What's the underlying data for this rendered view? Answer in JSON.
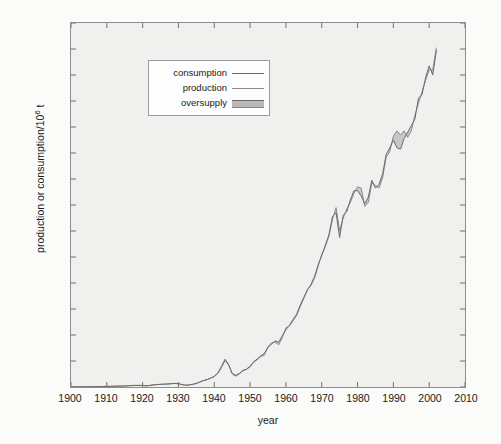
{
  "chart_data": {
    "type": "line",
    "title": "",
    "subtitle": "",
    "xlabel": "year",
    "ylabel": "production or consumption/10⁶ t",
    "ylabel_html": "production or consumption/10<sup>6</sup> t",
    "xlim": [
      1900,
      2010
    ],
    "ylim": [
      0,
      28
    ],
    "xticks": [
      1900,
      1910,
      1920,
      1930,
      1940,
      1950,
      1960,
      1970,
      1980,
      1990,
      2000,
      2010
    ],
    "yticks": [
      0,
      2,
      4,
      6,
      8,
      10,
      12,
      14,
      16,
      18,
      20,
      22,
      24,
      26,
      28
    ],
    "grid": false,
    "legend_position": "upper-left-inset",
    "legend": [
      {
        "label": "consumption",
        "marker": "line",
        "color": "#6b6b6b"
      },
      {
        "label": "production",
        "marker": "line",
        "color": "#8a8a8a"
      },
      {
        "label": "oversupply",
        "marker": "band",
        "color": "#b9b9b9"
      }
    ],
    "x": [
      1900,
      1901,
      1902,
      1903,
      1904,
      1905,
      1906,
      1907,
      1908,
      1909,
      1910,
      1911,
      1912,
      1913,
      1914,
      1915,
      1916,
      1917,
      1918,
      1919,
      1920,
      1921,
      1922,
      1923,
      1924,
      1925,
      1926,
      1927,
      1928,
      1929,
      1930,
      1931,
      1932,
      1933,
      1934,
      1935,
      1936,
      1937,
      1938,
      1939,
      1940,
      1941,
      1942,
      1943,
      1944,
      1945,
      1946,
      1947,
      1948,
      1949,
      1950,
      1951,
      1952,
      1953,
      1954,
      1955,
      1956,
      1957,
      1958,
      1959,
      1960,
      1961,
      1962,
      1963,
      1964,
      1965,
      1966,
      1967,
      1968,
      1969,
      1970,
      1971,
      1972,
      1973,
      1974,
      1975,
      1976,
      1977,
      1978,
      1979,
      1980,
      1981,
      1982,
      1983,
      1984,
      1985,
      1986,
      1987,
      1988,
      1989,
      1990,
      1991,
      1992,
      1993,
      1994,
      1995,
      1996,
      1997,
      1998,
      1999,
      2000,
      2001,
      2002
    ],
    "series": [
      {
        "name": "production",
        "color": "#8a8a8a",
        "values": [
          0.01,
          0.01,
          0.01,
          0.02,
          0.02,
          0.02,
          0.03,
          0.03,
          0.03,
          0.04,
          0.05,
          0.05,
          0.06,
          0.07,
          0.07,
          0.08,
          0.1,
          0.12,
          0.13,
          0.12,
          0.13,
          0.08,
          0.12,
          0.17,
          0.19,
          0.21,
          0.22,
          0.23,
          0.26,
          0.28,
          0.27,
          0.18,
          0.13,
          0.15,
          0.2,
          0.27,
          0.38,
          0.5,
          0.57,
          0.7,
          0.82,
          1.1,
          1.6,
          2.15,
          1.75,
          1.0,
          0.83,
          1.0,
          1.25,
          1.35,
          1.55,
          1.9,
          2.1,
          2.35,
          2.45,
          3.1,
          3.4,
          3.45,
          3.25,
          3.8,
          4.55,
          4.7,
          5.1,
          5.5,
          6.2,
          6.8,
          7.5,
          7.8,
          8.4,
          9.3,
          10.2,
          10.8,
          11.6,
          12.9,
          13.8,
          12.0,
          13.0,
          13.7,
          14.2,
          14.9,
          15.4,
          15.3,
          13.9,
          14.2,
          15.7,
          15.5,
          15.3,
          16.1,
          17.7,
          18.1,
          19.3,
          19.7,
          19.4,
          19.7,
          19.2,
          19.7,
          20.9,
          21.8,
          22.7,
          23.6,
          24.4,
          24.4,
          26.1
        ]
      },
      {
        "name": "consumption",
        "color": "#6b6b6b",
        "values": [
          0.01,
          0.01,
          0.01,
          0.02,
          0.02,
          0.02,
          0.03,
          0.03,
          0.03,
          0.04,
          0.05,
          0.05,
          0.06,
          0.07,
          0.07,
          0.08,
          0.09,
          0.11,
          0.12,
          0.12,
          0.12,
          0.09,
          0.12,
          0.16,
          0.18,
          0.2,
          0.22,
          0.23,
          0.25,
          0.27,
          0.25,
          0.19,
          0.14,
          0.16,
          0.21,
          0.28,
          0.39,
          0.49,
          0.56,
          0.68,
          0.8,
          1.05,
          1.5,
          2.05,
          1.7,
          1.05,
          0.9,
          1.05,
          1.28,
          1.38,
          1.6,
          1.95,
          2.15,
          2.4,
          2.6,
          3.05,
          3.3,
          3.55,
          3.45,
          3.95,
          4.4,
          4.75,
          5.2,
          5.6,
          6.3,
          6.9,
          7.45,
          7.9,
          8.5,
          9.4,
          10.1,
          10.9,
          11.7,
          13.1,
          13.4,
          11.5,
          13.2,
          13.5,
          14.4,
          15.1,
          15.1,
          14.7,
          14.1,
          14.6,
          15.9,
          15.3,
          15.6,
          16.4,
          17.9,
          18.4,
          19.0,
          18.4,
          18.3,
          19.1,
          19.6,
          20.1,
          20.6,
          22.2,
          22.5,
          23.8,
          24.7,
          24.0,
          25.9
        ]
      }
    ],
    "annotations": []
  },
  "figure": {
    "background_color": "#fbfbfa",
    "plot_background_color": "#f0f0ee",
    "axis_color": "#8d8d8d"
  }
}
